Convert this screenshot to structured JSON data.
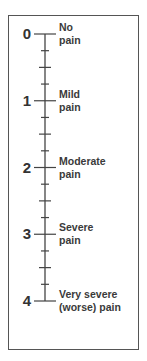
{
  "scale": {
    "min": 0,
    "max": 4,
    "subdivisions_per_unit": 4,
    "line_color": "#444444",
    "levels": [
      {
        "value": "0",
        "label_lines": [
          "No",
          "pain"
        ]
      },
      {
        "value": "1",
        "label_lines": [
          "Mild",
          "pain"
        ]
      },
      {
        "value": "2",
        "label_lines": [
          "Moderate",
          "pain"
        ]
      },
      {
        "value": "3",
        "label_lines": [
          "Severe",
          "pain"
        ]
      },
      {
        "value": "4",
        "label_lines": [
          "Very severe",
          "(worse) pain"
        ]
      }
    ]
  }
}
